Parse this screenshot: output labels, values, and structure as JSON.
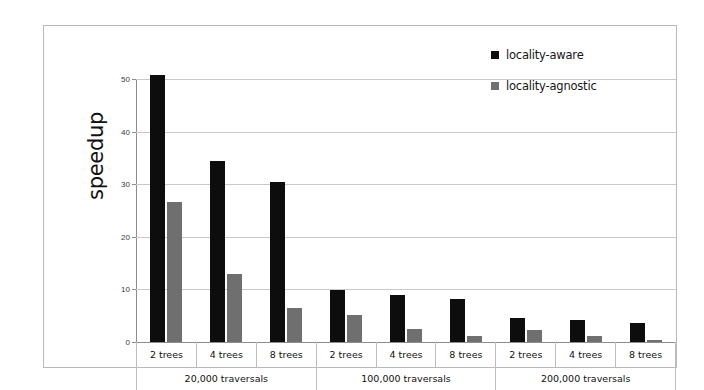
{
  "chart_data": {
    "type": "bar",
    "title": "",
    "xlabel": "",
    "ylabel": "speedup",
    "ylim": [
      0,
      52
    ],
    "yticks": [
      0,
      10,
      20,
      30,
      40,
      50
    ],
    "ytick_labels": [
      "0",
      "10",
      "20",
      "30",
      "40",
      "50"
    ],
    "grid": true,
    "legend_position": "top-right",
    "categories": [
      "2 trees",
      "4 trees",
      "8 trees",
      "2 trees",
      "4 trees",
      "8 trees",
      "2 trees",
      "4 trees",
      "8 trees"
    ],
    "group_labels": [
      "20,000 traversals",
      "100,000 traversals",
      "200,000 traversals"
    ],
    "group_size": 3,
    "series": [
      {
        "name": "locality-aware",
        "color": "#0d0d0d",
        "values": [
          50.7,
          34.5,
          30.5,
          9.8,
          9.0,
          8.1,
          4.5,
          4.2,
          3.7
        ]
      },
      {
        "name": "locality-agnostic",
        "color": "#6f6f6f",
        "values": [
          26.6,
          13.0,
          6.4,
          5.1,
          2.5,
          1.1,
          2.2,
          1.1,
          0.4
        ]
      }
    ]
  },
  "legend": {
    "items": [
      {
        "label": "locality-aware",
        "swatch": "aware"
      },
      {
        "label": "locality-agnostic",
        "swatch": "agnostic"
      }
    ]
  },
  "axis": {
    "y_title": "speedup"
  }
}
